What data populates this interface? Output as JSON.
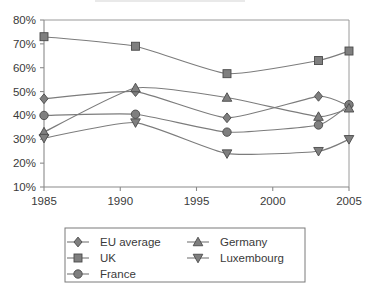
{
  "chart_data": {
    "type": "line",
    "title": "",
    "xlabel": "",
    "ylabel": "",
    "x": [
      1985,
      1991,
      1997,
      2003,
      2005
    ],
    "xlim": [
      1985,
      2005
    ],
    "ylim": [
      10,
      80
    ],
    "grid": false,
    "legend_position": "bottom",
    "xtick_labels": [
      "1985",
      "1990",
      "1995",
      "2000",
      "2005"
    ],
    "xtick_values": [
      1985,
      1990,
      1995,
      2000,
      2005
    ],
    "ytick_labels": [
      "10%",
      "20%",
      "30%",
      "40%",
      "50%",
      "60%",
      "70%",
      "80%"
    ],
    "ytick_values": [
      10,
      20,
      30,
      40,
      50,
      60,
      70,
      80
    ],
    "series": [
      {
        "name": "EU average",
        "marker": "diamond",
        "values": [
          47,
          50,
          39,
          48,
          44
        ]
      },
      {
        "name": "UK",
        "marker": "square",
        "values": [
          73,
          69,
          57.5,
          63,
          67
        ]
      },
      {
        "name": "France",
        "marker": "circle",
        "values": [
          40,
          40.5,
          33,
          36,
          44.5
        ]
      },
      {
        "name": "Germany",
        "marker": "triangle-up",
        "values": [
          33,
          51.5,
          47.5,
          39.5,
          43
        ]
      },
      {
        "name": "Luxembourg",
        "marker": "triangle-down",
        "values": [
          30.5,
          37,
          24,
          25,
          30
        ]
      }
    ]
  },
  "legend": {
    "entries": [
      {
        "label": "EU average",
        "marker": "diamond"
      },
      {
        "label": "UK",
        "marker": "square"
      },
      {
        "label": "France",
        "marker": "circle"
      },
      {
        "label": "Germany",
        "marker": "triangle-up"
      },
      {
        "label": "Luxembourg",
        "marker": "triangle-down"
      }
    ]
  },
  "colors": {
    "marker_fill": "#7f7f7f",
    "marker_stroke": "#4a4a4a",
    "line": "#7c7c7c",
    "axis": "#8a8a8a",
    "text": "#3a3a3a",
    "background": "#ffffff"
  }
}
